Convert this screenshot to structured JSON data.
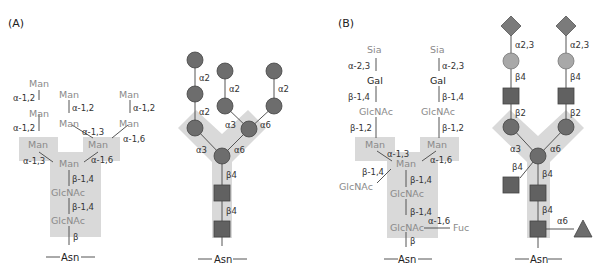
{
  "panels": {
    "a": {
      "label": "(A)",
      "text_structure": {
        "residues": {
          "man_top_left": "Man",
          "man_left_2": "Man",
          "man_mid_top": "Man",
          "man_mid_low": "Man",
          "man_right_top": "Man",
          "man_right_low": "Man",
          "man_left_branch": "Man",
          "man_right_branch": "Man",
          "man_core": "Man",
          "glcnac_1": "GlcNAc",
          "glcnac_2": "GlcNAc",
          "asn": "Asn"
        },
        "linkages": {
          "l1": "α-1,2",
          "l2": "α-1,2",
          "l3": "α-1,2",
          "l4": "α-1,2",
          "l5": "α-1,3",
          "l6": "α-1,6",
          "l7": "α-1,3",
          "l8": "α-1,6",
          "l9": "β-1,4",
          "l10": "β-1,4",
          "l11": "β"
        }
      },
      "symbol_structure": {
        "linkages": {
          "a2_left_top": "α2",
          "a2_left_bottom": "α2",
          "a2_mid": "α2",
          "a2_right": "α2",
          "a3_upper": "α3",
          "a6_upper": "α6",
          "a3_lower": "α3",
          "a6_lower": "α6",
          "b4_upper": "β4",
          "b4_lower": "β4"
        },
        "asn": "Asn"
      }
    },
    "b": {
      "label": "(B)",
      "text_structure": {
        "residues": {
          "sia_left": "Sia",
          "sia_right": "Sia",
          "gal_left": "Gal",
          "gal_right": "Gal",
          "glcnac_left": "GlcNAc",
          "glcnac_right": "GlcNAc",
          "man_left": "Man",
          "man_right": "Man",
          "man_core": "Man",
          "glcnac_bisect": "GlcNAc",
          "glcnac_1": "GlcNAc",
          "glcnac_2": "GlcNAc",
          "fuc": "Fuc",
          "asn": "Asn"
        },
        "linkages": {
          "sia_left": "α-2,3",
          "sia_right": "α-2,3",
          "gal_left": "β-1,4",
          "gal_right": "β-1,4",
          "glc_left": "β-1,2",
          "glc_right": "β-1,2",
          "man_left": "α-1,3",
          "man_right": "α-1,6",
          "bisect": "β-1,4",
          "core1": "β-1,4",
          "core2": "β-1,4",
          "fuc": "α-1,6",
          "asn": "β"
        }
      },
      "symbol_structure": {
        "linkages": {
          "a23_left": "α2,3",
          "a23_right": "α2,3",
          "b4_left": "β4",
          "b4_right": "β4",
          "b2_left": "β2",
          "b2_right": "β2",
          "a3": "α3",
          "a6": "α6",
          "b4_bisect": "β4",
          "b4_core1": "β4",
          "b4_core2": "β4",
          "a6_fuc": "α6"
        },
        "asn": "Asn"
      }
    }
  },
  "legend_colors": {
    "mannose": "#6d6d6d",
    "glcnac": "#616161",
    "galactose": "#a8a8a8",
    "sialic_acid": "#7b7b7b",
    "fucose": "#6d6d6d",
    "core_highlight": "#d9d9d9"
  }
}
